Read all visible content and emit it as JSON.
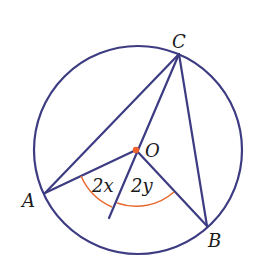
{
  "diagram": {
    "type": "circle-geometry",
    "colors": {
      "line": "#3d3b82",
      "arc": "#e8682e",
      "center_dot": "#f0602a",
      "background": "#ffffff"
    },
    "circle": {
      "cx": 138,
      "cy": 150,
      "r": 104
    },
    "points": {
      "O": {
        "label": "O",
        "x": 136,
        "y": 150
      },
      "A": {
        "label": "A",
        "x": 45,
        "y": 193
      },
      "B": {
        "label": "B",
        "x": 207,
        "y": 226
      },
      "C": {
        "label": "C",
        "x": 179,
        "y": 54
      }
    },
    "angle_labels": {
      "left": "2x",
      "right": "2y"
    }
  }
}
